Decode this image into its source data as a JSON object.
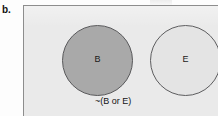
{
  "figure": {
    "panel_letter": "b.",
    "diagram_type": "venn-diagram"
  },
  "universe": {
    "fill_color": "#eaeaea",
    "border_color": "#8d8d8d"
  },
  "sets": [
    {
      "id": "B",
      "label": "B",
      "fill_color": "#a9a9a9",
      "border_color": "#59595b",
      "shaded": true
    },
    {
      "id": "E",
      "label": "E",
      "fill_color": "#e4e4e4",
      "border_color": "#5d5d5f",
      "shaded": false
    }
  ],
  "annotations": {
    "complement_label": "~(B or E)"
  }
}
